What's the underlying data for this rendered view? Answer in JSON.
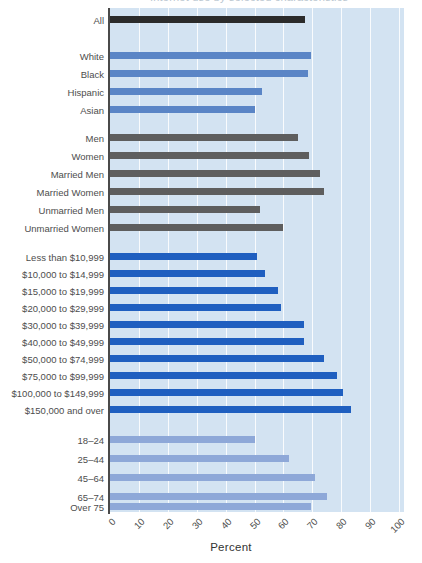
{
  "title": {
    "text": "Internet use by selected characteristics",
    "cropped": true
  },
  "axis": {
    "xlabel": "Percent",
    "ticks": [
      "0",
      "10",
      "20",
      "30",
      "40",
      "50",
      "60",
      "70",
      "80",
      "90",
      "100"
    ]
  },
  "colors": {
    "plot_background": "#d3e3f2",
    "gridline": "#ffffff",
    "all_bar": "#2b2b2b",
    "race_bar": "#5a85c6",
    "gender_bar": "#5e5e5e",
    "income_bar": "#1f5fc0",
    "age_bar": "#8ea8d8",
    "axis": "#4a4a4a",
    "text": "#4d4d4d"
  },
  "chart_data": {
    "type": "bar",
    "orientation": "horizontal",
    "title": "Internet use by selected characteristics",
    "xlabel": "Percent",
    "ylabel": "",
    "xlim": [
      0,
      100
    ],
    "xticks": [
      0,
      10,
      20,
      30,
      40,
      50,
      60,
      70,
      80,
      90,
      100
    ],
    "grid": true,
    "legend": "none",
    "groups": [
      {
        "name": "Total",
        "color": "#2b2b2b",
        "categories": [
          "All"
        ],
        "values": [
          67.5
        ]
      },
      {
        "name": "Race and Ethnicity",
        "color": "#5a85c6",
        "categories": [
          "White",
          "Black",
          "Hispanic",
          "Asian"
        ],
        "values": [
          69.5,
          68.5,
          52.5,
          50.0
        ]
      },
      {
        "name": "Sex and Marital Status",
        "color": "#5e5e5e",
        "categories": [
          "Men",
          "Women",
          "Married Men",
          "Married Women",
          "Unmarried Men",
          "Unmarried Women"
        ],
        "values": [
          65.0,
          69.0,
          72.5,
          74.0,
          52.0,
          60.0
        ]
      },
      {
        "name": "Household Income",
        "color": "#1f5fc0",
        "categories": [
          "Less than $10,999",
          "$10,000 to $14,999",
          "$15,000 to $19,999",
          "$20,000 to $29,999",
          "$30,000 to $39,999",
          "$40,000 to $49,999",
          "$50,000 to $74,999",
          "$75,000 to $99,999",
          "$100,000 to $149,999",
          "$150,000 and over"
        ],
        "values": [
          51.0,
          53.5,
          58.0,
          59.0,
          67.0,
          67.0,
          74.0,
          78.5,
          80.5,
          83.5
        ]
      },
      {
        "name": "Age",
        "color": "#8ea8d8",
        "categories": [
          "18–24",
          "25–44",
          "45–64",
          "65–74",
          "Over 75"
        ],
        "values": [
          50.0,
          62.0,
          71.0,
          75.0,
          69.5
        ]
      }
    ]
  },
  "rows": [
    {
      "label": "All",
      "value": 67.5,
      "color": "#2b2b2b",
      "y": 16
    },
    {
      "label": "White",
      "value": 69.5,
      "color": "#5a85c6",
      "y": 52
    },
    {
      "label": "Black",
      "value": 68.5,
      "color": "#5a85c6",
      "y": 70
    },
    {
      "label": "Hispanic",
      "value": 52.5,
      "color": "#5a85c6",
      "y": 88
    },
    {
      "label": "Asian",
      "value": 50.0,
      "color": "#5a85c6",
      "y": 106
    },
    {
      "label": "Men",
      "value": 65.0,
      "color": "#5e5e5e",
      "y": 134
    },
    {
      "label": "Women",
      "value": 69.0,
      "color": "#5e5e5e",
      "y": 152
    },
    {
      "label": "Married Men",
      "value": 72.5,
      "color": "#5e5e5e",
      "y": 170
    },
    {
      "label": "Married Women",
      "value": 74.0,
      "color": "#5e5e5e",
      "y": 188
    },
    {
      "label": "Unmarried Men",
      "value": 52.0,
      "color": "#5e5e5e",
      "y": 206
    },
    {
      "label": "Unmarried Women",
      "value": 60.0,
      "color": "#5e5e5e",
      "y": 224
    },
    {
      "label": "Less than $10,999",
      "value": 51.0,
      "color": "#1f5fc0",
      "y": 253
    },
    {
      "label": "$10,000 to $14,999",
      "value": 53.5,
      "color": "#1f5fc0",
      "y": 270
    },
    {
      "label": "$15,000 to $19,999",
      "value": 58.0,
      "color": "#1f5fc0",
      "y": 287
    },
    {
      "label": "$20,000 to $29,999",
      "value": 59.0,
      "color": "#1f5fc0",
      "y": 304
    },
    {
      "label": "$30,000 to $39,999",
      "value": 67.0,
      "color": "#1f5fc0",
      "y": 321
    },
    {
      "label": "$40,000 to $49,999",
      "value": 67.0,
      "color": "#1f5fc0",
      "y": 338
    },
    {
      "label": "$50,000 to $74,999",
      "value": 74.0,
      "color": "#1f5fc0",
      "y": 355
    },
    {
      "label": "$75,000 to $99,999",
      "value": 78.5,
      "color": "#1f5fc0",
      "y": 372
    },
    {
      "label": "$100,000 to $149,999",
      "value": 80.5,
      "color": "#1f5fc0",
      "y": 389
    },
    {
      "label": "$150,000 and over",
      "value": 83.5,
      "color": "#1f5fc0",
      "y": 406
    },
    {
      "label": "18–24",
      "value": 50.0,
      "color": "#8ea8d8",
      "y": 436
    },
    {
      "label": "25–44",
      "value": 62.0,
      "color": "#8ea8d8",
      "y": 455
    },
    {
      "label": "45–64",
      "value": 71.0,
      "color": "#8ea8d8",
      "y": 474
    },
    {
      "label": "65–74",
      "value": 75.0,
      "color": "#8ea8d8",
      "y": 493
    },
    {
      "label": "Over 75",
      "value": 69.5,
      "color": "#8ea8d8",
      "y": 503
    }
  ]
}
